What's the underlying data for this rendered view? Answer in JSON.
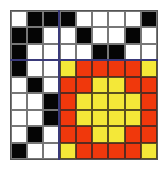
{
  "diagram": {
    "type": "pixel-grid",
    "rows": 9,
    "cols": 9,
    "colors": {
      "B": "#050505",
      "W": "#ffffff",
      "R": "#f0380c",
      "Y": "#f4e838",
      "divider": "#3a3a7a"
    },
    "divider_after_col": 3,
    "divider_after_row": 3,
    "cells": [
      [
        "W",
        "B",
        "B",
        "B",
        "W",
        "W",
        "W",
        "W",
        "B"
      ],
      [
        "B",
        "B",
        "W",
        "W",
        "B",
        "W",
        "W",
        "B",
        "W"
      ],
      [
        "B",
        "W",
        "W",
        "W",
        "W",
        "B",
        "B",
        "W",
        "W"
      ],
      [
        "B",
        "W",
        "W",
        "Y",
        "R",
        "R",
        "R",
        "R",
        "Y"
      ],
      [
        "W",
        "B",
        "W",
        "R",
        "R",
        "Y",
        "Y",
        "R",
        "R"
      ],
      [
        "W",
        "W",
        "B",
        "R",
        "Y",
        "Y",
        "Y",
        "Y",
        "R"
      ],
      [
        "W",
        "W",
        "B",
        "R",
        "Y",
        "Y",
        "Y",
        "Y",
        "R"
      ],
      [
        "W",
        "B",
        "W",
        "R",
        "R",
        "Y",
        "Y",
        "R",
        "R"
      ],
      [
        "B",
        "W",
        "W",
        "Y",
        "R",
        "R",
        "R",
        "R",
        "Y"
      ]
    ]
  }
}
